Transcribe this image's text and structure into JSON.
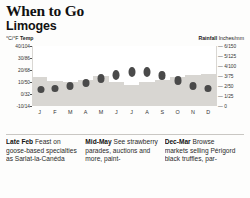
{
  "header": {
    "title": "When to Go",
    "subtitle": "Limoges"
  },
  "legend": {
    "temp_units": "°C/°F",
    "temp_label": "Temp",
    "rain_label": "Rainfall",
    "rain_units": "Inches/mm"
  },
  "chart_data": {
    "type": "bar",
    "xlabel": "",
    "ylabel": "°C/°F Temp",
    "y2label": "Rainfall Inches/mm",
    "grid": false,
    "legend_position": "top",
    "categories": [
      "J",
      "F",
      "M",
      "A",
      "M",
      "J",
      "J",
      "A",
      "S",
      "O",
      "N",
      "D"
    ],
    "left_axis": {
      "label": "°C/°F Temp",
      "ticks": [
        "40/104",
        "30/86",
        "20/68",
        "10/50",
        "0/32",
        "-10/14"
      ],
      "values": [
        40,
        30,
        20,
        10,
        0,
        -10
      ],
      "ylim": [
        -10,
        40
      ]
    },
    "right_axis": {
      "label": "Rainfall Inches/mm",
      "ticks": [
        "6/150",
        "5/125",
        "4/100",
        "3/75",
        "2/50",
        "1/25",
        "0"
      ],
      "values": [
        6,
        5,
        4,
        3,
        2,
        1,
        0
      ],
      "ylim": [
        0,
        6
      ]
    },
    "series": [
      {
        "name": "Temp",
        "type": "marker",
        "unit": "°C",
        "values": [
          4,
          4.5,
          7,
          9,
          13,
          16,
          18.5,
          18.5,
          15.5,
          11.5,
          7,
          4.5
        ]
      },
      {
        "name": "Rainfall",
        "type": "bar",
        "unit": "inches",
        "values": [
          2.9,
          2.5,
          2.4,
          2.6,
          3.0,
          2.4,
          2.1,
          2.4,
          2.6,
          2.9,
          3.1,
          3.2
        ]
      }
    ]
  },
  "tips": [
    {
      "lead": "Late Feb",
      "text": " Feast on goose-based specialties as Sarlat-la-Canéda"
    },
    {
      "lead": "Mid-May",
      "text": " See strawberry parades, auctions and more, paint-"
    },
    {
      "lead": "Dec-Mar",
      "text": " Browse markets selling Périgord black truffles, par-"
    }
  ],
  "colors": {
    "marker": "#4a4a4a",
    "bar": "#d8d6d2",
    "plot_bg": "#f4f3f1",
    "column_bg": "#ffffff"
  }
}
